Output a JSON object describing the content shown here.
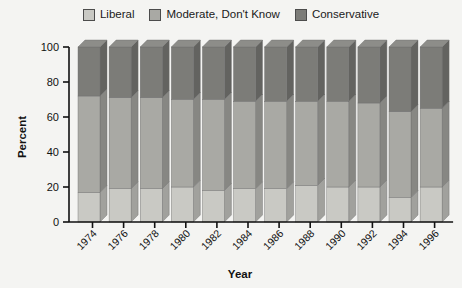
{
  "chart_data": {
    "type": "bar",
    "subtype": "stacked-percentage-3d",
    "title": "",
    "xlabel": "Year",
    "ylabel": "Percent",
    "ylim": [
      0,
      100
    ],
    "yticks": [
      0,
      20,
      40,
      60,
      80,
      100
    ],
    "grid": false,
    "legend_position": "top-center",
    "categories": [
      "1974",
      "1976",
      "1978",
      "1980",
      "1982",
      "1984",
      "1986",
      "1988",
      "1990",
      "1992",
      "1994",
      "1996"
    ],
    "series": [
      {
        "name": "Liberal",
        "color": "#c9c9c4",
        "values": [
          17,
          19,
          19,
          20,
          18,
          19,
          19,
          21,
          20,
          20,
          14,
          20
        ]
      },
      {
        "name": "Moderate, Don't Know",
        "color": "#a9a9a4",
        "values": [
          55,
          52,
          52,
          50,
          52,
          50,
          50,
          48,
          49,
          48,
          49,
          45
        ]
      },
      {
        "name": "Conservative",
        "color": "#7c7c78",
        "values": [
          28,
          29,
          29,
          30,
          30,
          31,
          31,
          31,
          31,
          32,
          37,
          35
        ]
      }
    ],
    "cumulative_tops": {
      "liberal": [
        17,
        19,
        19,
        20,
        18,
        19,
        19,
        21,
        20,
        20,
        14,
        20
      ],
      "moderate": [
        72,
        71,
        71,
        70,
        70,
        69,
        69,
        69,
        69,
        68,
        63,
        65
      ]
    }
  },
  "legend": {
    "items": [
      {
        "label": "Liberal",
        "color": "#c9c9c4",
        "swatch_name": "legend-swatch-liberal"
      },
      {
        "label": "Moderate, Don't Know",
        "color": "#a9a9a4",
        "swatch_name": "legend-swatch-moderate"
      },
      {
        "label": "Conservative",
        "color": "#7c7c78",
        "swatch_name": "legend-swatch-conservative"
      }
    ]
  },
  "axes": {
    "y_title": "Percent",
    "x_title": "Year",
    "y_ticks": [
      "0",
      "20",
      "40",
      "60",
      "80",
      "100"
    ],
    "x_ticks": [
      "1974",
      "1976",
      "1978",
      "1980",
      "1982",
      "1984",
      "1986",
      "1988",
      "1990",
      "1992",
      "1994",
      "1996"
    ]
  },
  "colors": {
    "background": "#f4f4f2",
    "axis": "#111111",
    "liberal": "#c9c9c4",
    "moderate": "#a9a9a4",
    "conservative": "#7c7c78",
    "bar_side_dark": "#6b6b67",
    "bar_top_light": "#8e8e8a"
  }
}
